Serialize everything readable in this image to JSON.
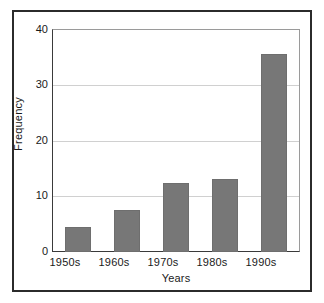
{
  "figure": {
    "background_color": "#ffffff",
    "frame_color": "#2b2b2b",
    "axis_color": "#3a3a3a",
    "grid_color": "#d0d0d0",
    "bar_color": "#777777"
  },
  "chart_data": {
    "type": "bar",
    "title": "",
    "subtitle": "",
    "xlabel": "Years",
    "ylabel": "Frequency",
    "categories": [
      "1950s",
      "1960s",
      "1970s",
      "1980s",
      "1990s"
    ],
    "values": [
      4.5,
      7.5,
      12.5,
      13.2,
      35.7
    ],
    "ylim": [
      0,
      40
    ],
    "yticks": [
      0,
      10,
      20,
      30,
      40
    ],
    "ytick_labels": [
      "0",
      "10",
      "20",
      "30",
      "40"
    ],
    "grid": "horizontal",
    "legend": null,
    "legend_position": "none",
    "annotations": []
  }
}
